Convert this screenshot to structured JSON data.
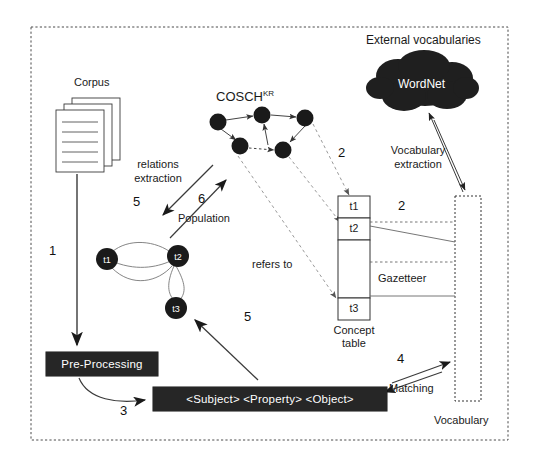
{
  "figure": {
    "border_style": "dashed"
  },
  "labels": {
    "external_vocabularies": "External vocabularies",
    "corpus": "Corpus",
    "cosch_base": "COSCH",
    "cosch_sup": "KR",
    "wordnet": "WordNet",
    "relations_extraction_line1": "relations",
    "relations_extraction_line2": "extraction",
    "population": "Population",
    "vocabulary_extraction_line1": "Vocabulary",
    "vocabulary_extraction_line2": "extraction",
    "refers_to": "refers to",
    "gazetteer": "Gazetteer",
    "concept_table_line1": "Concept",
    "concept_table_line2": "table",
    "vocabulary": "Vocabulary",
    "matching": "Matching",
    "pre_processing": "Pre-Processing",
    "triple": "<Subject> <Property> <Object>"
  },
  "step_numbers": {
    "step1": "1",
    "step2_concept": "2",
    "step2_gazetteer": "2",
    "step3": "3",
    "step4": "4",
    "step5_relations": "5",
    "step5_triple": "5",
    "step6": "6"
  },
  "concept_table": {
    "cells": [
      "t1",
      "t2",
      "",
      "t3"
    ]
  },
  "triple_graph": {
    "nodes": [
      "t1",
      "t2",
      "t3"
    ]
  },
  "cosch_graph": {
    "node_count": 5,
    "node_color": "#1a1a1a"
  },
  "colors": {
    "ink": "#1a1a1a",
    "box_fill": "#262626",
    "box_text": "#ffffff",
    "line": "#555555",
    "dashed_line": "#9a9a9a"
  }
}
